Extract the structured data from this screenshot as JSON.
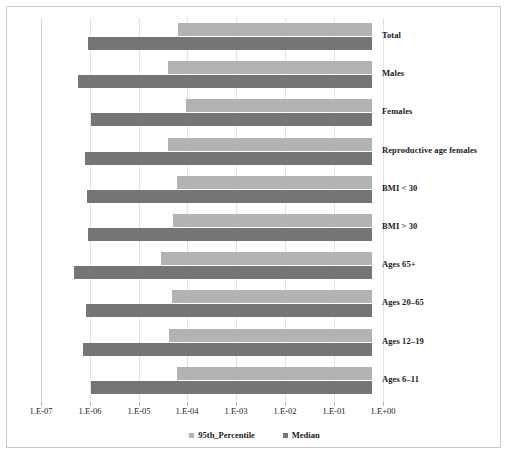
{
  "colors": {
    "p95": "#b3b3b3",
    "median": "#757575",
    "grid": "#e2e2e2",
    "frame": "#c9c9c9",
    "text": "#1a1a1a"
  },
  "legend": {
    "position": "bottom-center",
    "entries": [
      {
        "label": "95th_Percentile",
        "color": "#b3b3b3"
      },
      {
        "label": "Median",
        "color": "#757575"
      }
    ]
  },
  "axis": {
    "scale": "log10",
    "ticks": [
      {
        "label": "1.E-07",
        "value": 1e-07,
        "x": 41
      },
      {
        "label": "1.E-06",
        "value": 1e-06,
        "x": 90
      },
      {
        "label": "1.E-05",
        "value": 1e-05,
        "x": 139
      },
      {
        "label": "1.E-04",
        "value": 0.0001,
        "x": 187
      },
      {
        "label": "1.E-03",
        "value": 0.001,
        "x": 236
      },
      {
        "label": "1.E-02",
        "value": 0.01,
        "x": 285
      },
      {
        "label": "1.E-01",
        "value": 0.1,
        "x": 334
      },
      {
        "label": "1.E+00",
        "value": 1.0,
        "x": 383
      }
    ]
  },
  "chart_data": {
    "type": "bar",
    "orientation": "horizontal",
    "title": "",
    "subtitle": "",
    "xlabel": "",
    "ylabel": "",
    "xscale": "log",
    "xlim": [
      1e-07,
      1.0
    ],
    "grid": true,
    "legend_position": "bottom-center",
    "note": "Floating horizontal bars: each bar spans from its start value to a common right end near 6E-01.",
    "bar_end_value": 0.6,
    "categories": [
      "Total",
      "Males",
      "Females",
      "Reproductive age females",
      "BMI < 30",
      "BMI > 30",
      "Ages 65+",
      "Ages 20–65",
      "Ages 12–19",
      "Ages 6–11"
    ],
    "series": [
      {
        "name": "95th_Percentile",
        "color": "#b3b3b3",
        "start_values": [
          6.2e-05,
          3.4e-05,
          0.00012,
          3.4e-05,
          5.6e-05,
          4.6e-05,
          1.3e-05,
          3.9e-05,
          3e-05,
          5.6e-05
        ],
        "end_values": [
          0.6,
          0.6,
          0.6,
          0.6,
          0.6,
          0.6,
          0.6,
          0.6,
          0.6,
          0.6
        ]
      },
      {
        "name": "Median",
        "color": "#757575",
        "start_values": [
          1.1e-06,
          5.3e-07,
          1.3e-06,
          8.8e-07,
          1e-06,
          1.1e-06,
          2.3e-07,
          1e-06,
          7e-07,
          1.3e-06
        ],
        "end_values": [
          0.6,
          0.6,
          0.6,
          0.6,
          0.6,
          0.6,
          0.6,
          0.6,
          0.6,
          0.6
        ]
      }
    ],
    "bars_px": [
      {
        "category": "Total",
        "p95": {
          "x0": 178,
          "x1": 372
        },
        "median": {
          "x0": 88,
          "x1": 372
        }
      },
      {
        "category": "Males",
        "p95": {
          "x0": 168,
          "x1": 372
        },
        "median": {
          "x0": 78,
          "x1": 372
        }
      },
      {
        "category": "Females",
        "p95": {
          "x0": 186,
          "x1": 372
        },
        "median": {
          "x0": 91,
          "x1": 372
        }
      },
      {
        "category": "Reproductive age females",
        "p95": {
          "x0": 168,
          "x1": 372
        },
        "median": {
          "x0": 85,
          "x1": 372
        }
      },
      {
        "category": "BMI < 30",
        "p95": {
          "x0": 177,
          "x1": 372
        },
        "median": {
          "x0": 87,
          "x1": 372
        }
      },
      {
        "category": "BMI > 30",
        "p95": {
          "x0": 173,
          "x1": 372
        },
        "median": {
          "x0": 88,
          "x1": 372
        }
      },
      {
        "category": "Ages 65+",
        "p95": {
          "x0": 161,
          "x1": 372
        },
        "median": {
          "x0": 74,
          "x1": 372
        }
      },
      {
        "category": "Ages 20–65",
        "p95": {
          "x0": 172,
          "x1": 372
        },
        "median": {
          "x0": 86,
          "x1": 372
        }
      },
      {
        "category": "Ages 12–19",
        "p95": {
          "x0": 169,
          "x1": 372
        },
        "median": {
          "x0": 83,
          "x1": 372
        }
      },
      {
        "category": "Ages 6–11",
        "p95": {
          "x0": 177,
          "x1": 372
        },
        "median": {
          "x0": 91,
          "x1": 372
        }
      }
    ]
  }
}
